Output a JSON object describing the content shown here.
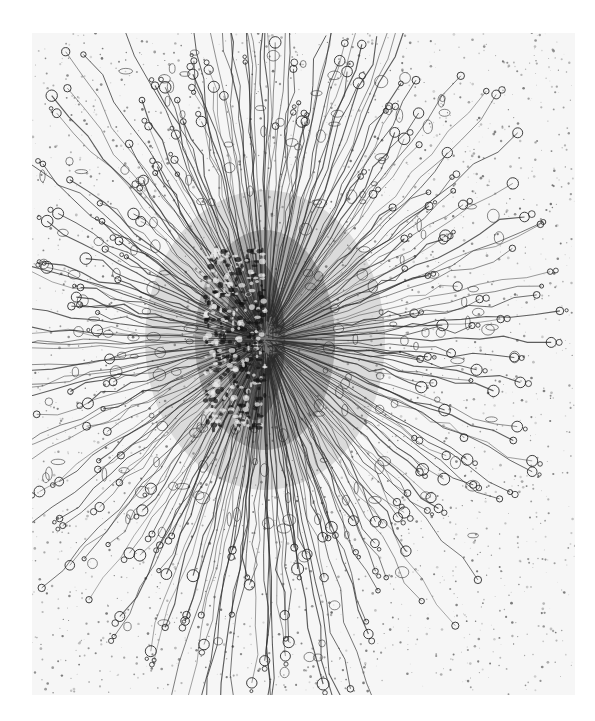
{
  "image": {
    "subject": "electron micrograph of a radial rosette of fibrous strands with looped ends",
    "description": "Dense dark center with hundreds of fibers radiating outward, terminating in small loops and beads, over a speckled light gray background",
    "colors": {
      "page_background": "#ffffff",
      "photo_background": "#f6f6f6",
      "strand": "#2a2a2a",
      "core": "#3a3a3a",
      "speckle": "#555555"
    },
    "photo_bounds": {
      "x": 32,
      "y": 33,
      "width": 543,
      "height": 662
    },
    "center": {
      "x": 265,
      "y": 340
    }
  }
}
